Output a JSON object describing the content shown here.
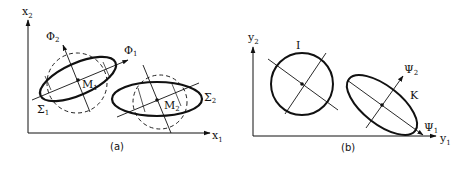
{
  "panels": [
    {
      "caption": "(a)",
      "x_axis": {
        "base": "x",
        "sub": "1"
      },
      "y_axis": {
        "base": "x",
        "sub": "2"
      },
      "ellipses": [
        {
          "label_base": "Σ",
          "label_sub": "1",
          "center_base": "M",
          "center_sub": "1"
        },
        {
          "label_base": "Σ",
          "label_sub": "2",
          "center_base": "M",
          "center_sub": "2"
        }
      ],
      "eigen_axes": [
        {
          "base": "Φ",
          "sub": "1"
        },
        {
          "base": "Φ",
          "sub": "2"
        }
      ]
    },
    {
      "caption": "(b)",
      "x_axis": {
        "base": "y",
        "sub": "1"
      },
      "y_axis": {
        "base": "y",
        "sub": "2"
      },
      "shapes": [
        {
          "label": "I",
          "type": "circle"
        },
        {
          "label": "K",
          "type": "ellipse"
        }
      ],
      "eigen_axes": [
        {
          "base": "Ψ",
          "sub": "1"
        },
        {
          "base": "Ψ",
          "sub": "2"
        }
      ]
    }
  ]
}
